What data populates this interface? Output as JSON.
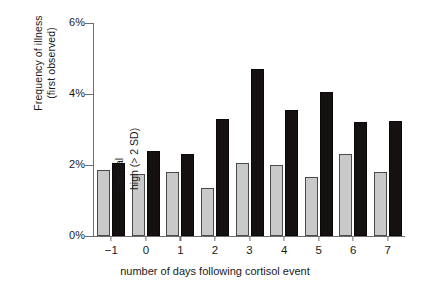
{
  "chart_data": {
    "type": "bar",
    "title": "",
    "subtitle": "",
    "xlabel": "number of days following cortisol event",
    "ylabel": "Frequency of illness\n(first observed)",
    "categories": [
      "−1",
      "0",
      "1",
      "2",
      "3",
      "4",
      "5",
      "6",
      "7"
    ],
    "ytick_labels": [
      "0%",
      "2%",
      "4%",
      "6%"
    ],
    "ytick_values": [
      0,
      2,
      4,
      6
    ],
    "ylim": [
      0,
      6
    ],
    "grid": false,
    "legend_position": "inline-above-bars-day0",
    "series": [
      {
        "name": "normal",
        "color": "#c9c9c9",
        "values": [
          1.85,
          1.75,
          1.8,
          1.35,
          2.05,
          2.0,
          1.65,
          2.3,
          1.8
        ]
      },
      {
        "name": "high (> 2 SD)",
        "color": "#151110",
        "values": [
          2.05,
          2.4,
          2.3,
          3.3,
          4.7,
          3.55,
          4.05,
          3.2,
          3.25
        ]
      }
    ]
  },
  "legend": {
    "normal_label": "normal",
    "high_label": "high (> 2 SD)"
  }
}
